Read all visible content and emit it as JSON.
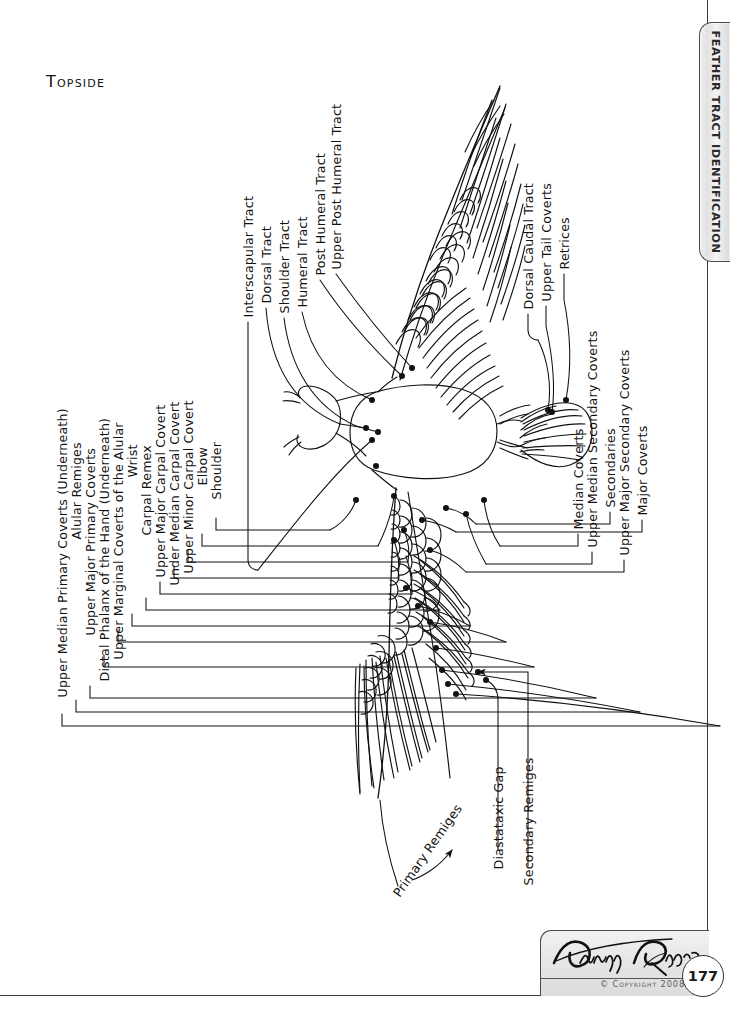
{
  "page": {
    "title": "Topside",
    "number": "177",
    "copyright": "© Copyright 2008",
    "signature": "Denny Rodgers",
    "side_tab": "Feather Tract Identification"
  },
  "labels": {
    "left_column": [
      {
        "id": "upper-median-primary-coverts",
        "text": "Upper Median Primary Coverts (Underneath)",
        "x": 62,
        "y": 690,
        "stub": 12,
        "run": 648,
        "ty": 714
      },
      {
        "id": "alular-remiges",
        "text": "Alular Remiges",
        "x": 76,
        "y": 532,
        "stub": 12,
        "run": 560,
        "ty": 700
      },
      {
        "id": "upper-major-primary-coverts",
        "text": "Upper Major Primary Coverts",
        "x": 90,
        "y": 628,
        "stub": 12,
        "run": 500,
        "ty": 686
      },
      {
        "id": "distal-phalanx-of-the-hand",
        "text": "Distal Phalanx of the Hand (Underneath)",
        "x": 104,
        "y": 674,
        "stub": 12,
        "run": 428,
        "ty": 655
      },
      {
        "id": "upper-marginal-coverts-of-the-alular",
        "text": "Upper Marginal Coverts of the Alular",
        "x": 118,
        "y": 652,
        "stub": 12,
        "run": 386,
        "ty": 630
      },
      {
        "id": "wrist",
        "text": "Wrist",
        "x": 132,
        "y": 470,
        "stub": 12,
        "run": 352,
        "ty": 614
      },
      {
        "id": "carpal-remex",
        "text": "Carpal Remex",
        "x": 146,
        "y": 528,
        "stub": 12,
        "run": 318,
        "ty": 598
      },
      {
        "id": "upper-major-carpal-covert",
        "text": "Upper Major Carpal Covert",
        "x": 160,
        "y": 570,
        "stub": 12,
        "run": 284,
        "ty": 582
      },
      {
        "id": "under-median-carpal-covert",
        "text": "Under Median Carpal Covert",
        "x": 174,
        "y": 578,
        "stub": 12,
        "run": 250,
        "ty": 566
      },
      {
        "id": "upper-minor-carpal-covert",
        "text": "Upper Minor Carpal Covert",
        "x": 188,
        "y": 566,
        "stub": 12,
        "run": 216,
        "ty": 550
      },
      {
        "id": "elbow",
        "text": "Elbow",
        "x": 202,
        "y": 478,
        "stub": 12,
        "run": 182,
        "ty": 534
      },
      {
        "id": "shoulder",
        "text": "Shoulder",
        "x": 216,
        "y": 492,
        "stub": 12,
        "run": 148,
        "ty": 518
      }
    ],
    "top_column": [
      {
        "id": "interscapular-tract",
        "text": "Interscapular Tract",
        "x": 248,
        "y": 310
      },
      {
        "id": "dorsal-tract",
        "text": "Dorsal Tract",
        "x": 266,
        "y": 296
      },
      {
        "id": "shoulder-tract",
        "text": "Shoulder Tract",
        "x": 284,
        "y": 306
      },
      {
        "id": "humeral-tract",
        "text": "Humeral Tract",
        "x": 302,
        "y": 300
      },
      {
        "id": "post-humeral-tract",
        "text": "Post Humeral Tract",
        "x": 320,
        "y": 268
      },
      {
        "id": "upper-post-humeral-tract",
        "text": "Upper Post Humeral Tract",
        "x": 336,
        "y": 262
      }
    ],
    "right_column": [
      {
        "id": "dorsal-caudal-tract",
        "text": "Dorsal Caudal Tract",
        "x": 528,
        "y": 302
      },
      {
        "id": "upper-tail-coverts",
        "text": "Upper Tail Coverts",
        "x": 546,
        "y": 294
      },
      {
        "id": "retrices",
        "text": "Retrices",
        "x": 564,
        "y": 262
      },
      {
        "id": "median-coverts",
        "text": "Median Coverts",
        "x": 578,
        "y": 522
      },
      {
        "id": "upper-median-secondary-coverts",
        "text": "Upper Median Secondary Coverts",
        "x": 592,
        "y": 540
      },
      {
        "id": "secondaries",
        "text": "Secondaries",
        "x": 610,
        "y": 500
      },
      {
        "id": "upper-major-secondary-coverts",
        "text": "Upper Major Secondary Coverts",
        "x": 624,
        "y": 548
      },
      {
        "id": "major-coverts",
        "text": "Major Coverts",
        "x": 642,
        "y": 508
      }
    ],
    "bottom": [
      {
        "id": "diastataxic-gap",
        "text": "Diastataxic Gap",
        "x": 498,
        "y": 862
      },
      {
        "id": "secondary-remiges",
        "text": "Secondary Remiges",
        "x": 528,
        "y": 878
      }
    ],
    "diagonal": [
      {
        "id": "primary-remiges",
        "text": "Primary Remiges",
        "x": 396,
        "y": 888,
        "rotate": -55
      }
    ]
  }
}
